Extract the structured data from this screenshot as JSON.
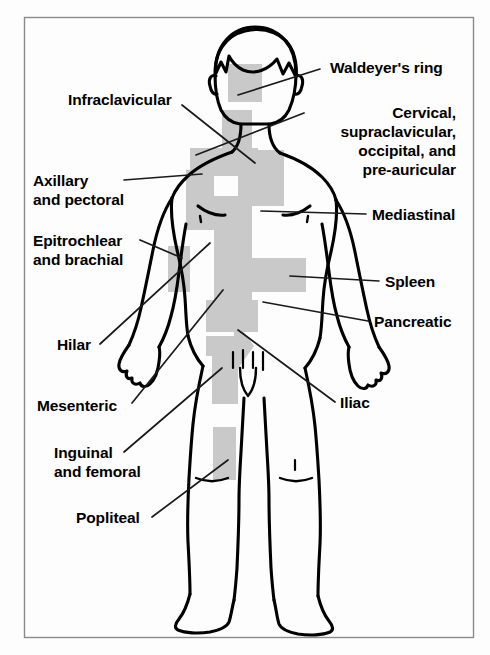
{
  "figure": {
    "border_color": "#8a8a8a",
    "background_color": "#fdfdfd",
    "outline_color": "#000000",
    "shading_color": "#c9c9c9",
    "leader_line_color": "#1a1a1a"
  },
  "labels": [
    {
      "id": "waldeyers-ring",
      "text": "Waldeyer's ring",
      "align": "left",
      "x": 330,
      "y": 58,
      "leader": {
        "x1": 320,
        "y1": 69,
        "x2": 238,
        "y2": 95
      }
    },
    {
      "id": "infraclavicular",
      "text": "Infraclavicular",
      "align": "left",
      "x": 68,
      "y": 90,
      "leader": {
        "x1": 182,
        "y1": 105,
        "x2": 255,
        "y2": 163
      }
    },
    {
      "id": "cervical-supraclavicular-occipital-pre-auricular",
      "text": "Cervical,\nsupraclavicular,\noccipital, and\npre-auricular",
      "align": "right",
      "x": 456,
      "y": 103,
      "leader": {
        "x1": 304,
        "y1": 113,
        "x2": 196,
        "y2": 155
      }
    },
    {
      "id": "axillary-and-pectoral",
      "text": "Axillary\nand pectoral",
      "align": "left",
      "x": 33,
      "y": 171,
      "leader": {
        "x1": 124,
        "y1": 180,
        "x2": 202,
        "y2": 174
      }
    },
    {
      "id": "mediastinal",
      "text": "Mediastinal",
      "align": "left",
      "x": 372,
      "y": 205,
      "leader": {
        "x1": 366,
        "y1": 214,
        "x2": 261,
        "y2": 211
      }
    },
    {
      "id": "epitrochlear-and-brachial",
      "text": "Epitrochlear\nand brachial",
      "align": "left",
      "x": 33,
      "y": 231,
      "leader": {
        "x1": 140,
        "y1": 240,
        "x2": 182,
        "y2": 258
      }
    },
    {
      "id": "spleen",
      "text": "Spleen",
      "align": "left",
      "x": 385,
      "y": 272,
      "leader": {
        "x1": 379,
        "y1": 281,
        "x2": 290,
        "y2": 276
      }
    },
    {
      "id": "pancreatic",
      "text": "Pancreatic",
      "align": "left",
      "x": 374,
      "y": 312,
      "leader": {
        "x1": 368,
        "y1": 321,
        "x2": 263,
        "y2": 302
      }
    },
    {
      "id": "hilar",
      "text": "Hilar",
      "align": "left",
      "x": 57,
      "y": 335,
      "leader": {
        "x1": 100,
        "y1": 344,
        "x2": 210,
        "y2": 243
      }
    },
    {
      "id": "mesenteric",
      "text": "Mesenteric",
      "align": "left",
      "x": 37,
      "y": 396,
      "leader": {
        "x1": 132,
        "y1": 403,
        "x2": 223,
        "y2": 290
      }
    },
    {
      "id": "iliac",
      "text": "Iliac",
      "align": "left",
      "x": 340,
      "y": 393,
      "leader": {
        "x1": 335,
        "y1": 402,
        "x2": 238,
        "y2": 330
      }
    },
    {
      "id": "inguinal-and-femoral",
      "text": "Inguinal\nand femoral",
      "align": "left",
      "x": 54,
      "y": 443,
      "leader": {
        "x1": 124,
        "y1": 452,
        "x2": 222,
        "y2": 368
      }
    },
    {
      "id": "popliteal",
      "text": "Popliteal",
      "align": "left",
      "x": 76,
      "y": 508,
      "leader": {
        "x1": 152,
        "y1": 517,
        "x2": 228,
        "y2": 460
      }
    }
  ]
}
